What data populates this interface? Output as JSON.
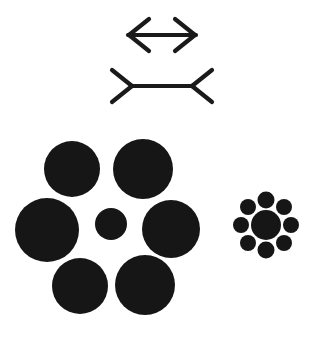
{
  "canvas": {
    "width": 311,
    "height": 338,
    "background_color": "#ffffff",
    "ink_color": "#161616"
  },
  "figure": {
    "name": "visual-illusion-plate"
  },
  "muller_lyer": {
    "name": "muller-lyer-illusion",
    "stroke_color": "#1a1a1a",
    "stroke_width": 4.2,
    "figures": [
      {
        "id": "arrows-outward",
        "label": "double-headed arrow with outward fins",
        "shaft": {
          "x1": 128,
          "y1": 35,
          "x2": 196,
          "y2": 35
        },
        "fins": [
          {
            "x1": 128,
            "y1": 35,
            "x2": 148,
            "y2": 19
          },
          {
            "x1": 128,
            "y1": 35,
            "x2": 148,
            "y2": 51
          },
          {
            "x1": 196,
            "y1": 35,
            "x2": 176,
            "y2": 19
          },
          {
            "x1": 196,
            "y1": 35,
            "x2": 176,
            "y2": 51
          }
        ]
      },
      {
        "id": "arrows-inward",
        "label": "line with inward reversed fins",
        "shaft": {
          "x1": 131,
          "y1": 86,
          "x2": 193,
          "y2": 86
        },
        "fins": [
          {
            "x1": 131,
            "y1": 86,
            "x2": 111,
            "y2": 70
          },
          {
            "x1": 131,
            "y1": 86,
            "x2": 111,
            "y2": 102
          },
          {
            "x1": 193,
            "y1": 86,
            "x2": 213,
            "y2": 70
          },
          {
            "x1": 193,
            "y1": 86,
            "x2": 213,
            "y2": 102
          }
        ]
      }
    ]
  },
  "ebbinghaus": {
    "name": "ebbinghaus-illusion",
    "fill_color": "#161616",
    "clusters": [
      {
        "id": "cluster-large-inducers",
        "label": "center circle surrounded by six large circles",
        "center_circle": {
          "cx": 111,
          "cy": 224,
          "r": 16
        },
        "inducer_count": 6,
        "inducer_radius_avg": 29,
        "inducers": [
          {
            "cx": 72,
            "cy": 169,
            "r": 28
          },
          {
            "cx": 143,
            "cy": 169,
            "r": 30
          },
          {
            "cx": 47,
            "cy": 230,
            "r": 32
          },
          {
            "cx": 171,
            "cy": 229,
            "r": 29
          },
          {
            "cx": 80,
            "cy": 286,
            "r": 28
          },
          {
            "cx": 145,
            "cy": 285,
            "r": 30
          }
        ]
      },
      {
        "id": "cluster-small-inducers",
        "label": "center circle surrounded by eight small circles",
        "center_circle": {
          "cx": 266,
          "cy": 225,
          "r": 15
        },
        "inducer_count": 8,
        "inducer_radius_avg": 8,
        "inducers": [
          {
            "cx": 266,
            "cy": 200,
            "r": 8.5
          },
          {
            "cx": 284,
            "cy": 207,
            "r": 8
          },
          {
            "cx": 291,
            "cy": 225,
            "r": 8
          },
          {
            "cx": 284,
            "cy": 243,
            "r": 8
          },
          {
            "cx": 266,
            "cy": 250,
            "r": 8.5
          },
          {
            "cx": 248,
            "cy": 243,
            "r": 8
          },
          {
            "cx": 241,
            "cy": 225,
            "r": 8
          },
          {
            "cx": 248,
            "cy": 207,
            "r": 8
          }
        ]
      }
    ]
  }
}
